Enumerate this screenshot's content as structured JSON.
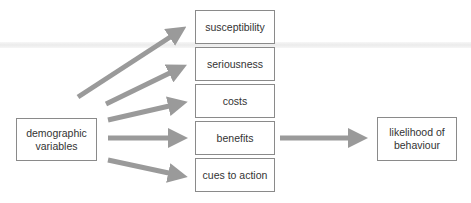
{
  "diagram": {
    "source": {
      "label_line1": "demographic",
      "label_line2": "variables"
    },
    "factors": [
      {
        "label": "susceptibility"
      },
      {
        "label": "seriousness"
      },
      {
        "label": "costs"
      },
      {
        "label": "benefits"
      },
      {
        "label": "cues to action"
      }
    ],
    "outcome": {
      "label_line1": "likelihood of",
      "label_line2": "behaviour"
    },
    "arrow_color": "#9a9a9a",
    "border_color": "#8a8a8a"
  }
}
